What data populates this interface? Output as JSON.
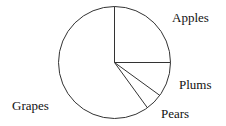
{
  "chart_data": {
    "type": "pie",
    "title": "",
    "categories": [
      "Apples",
      "Plums",
      "Pears",
      "Grapes"
    ],
    "values": [
      25,
      10,
      5,
      60
    ],
    "start_angle": "12 o'clock",
    "direction": "clockwise",
    "fill": "none",
    "stroke": "#333333"
  },
  "labels": {
    "apples": "Apples",
    "plums": "Plums",
    "pears": "Pears",
    "grapes": "Grapes"
  }
}
